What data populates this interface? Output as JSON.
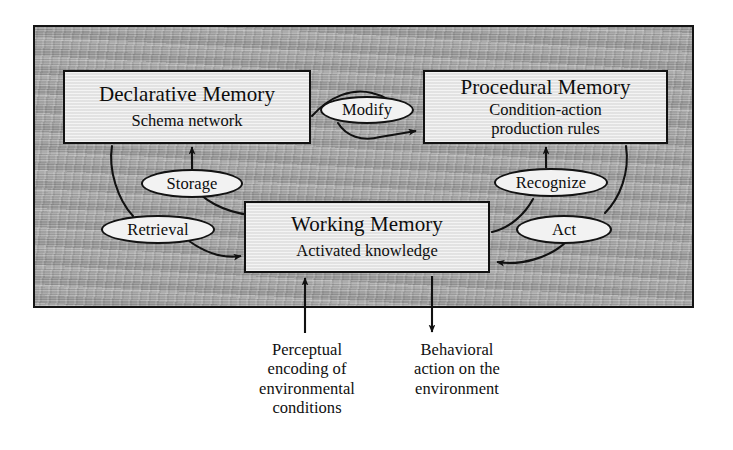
{
  "diagram": {
    "panel": {
      "name": "shaded-background-panel",
      "fill_color": "#a5a5a5",
      "border_color": "#141414"
    },
    "nodes": [
      {
        "id": "declarative-memory",
        "title": "Declarative Memory",
        "subtitle_line1": "Schema network",
        "subtitle_line2": ""
      },
      {
        "id": "procedural-memory",
        "title": "Procedural Memory",
        "subtitle_line1": "Condition-action",
        "subtitle_line2": "production rules"
      },
      {
        "id": "working-memory",
        "title": "Working Memory",
        "subtitle_line1": "Activated knowledge",
        "subtitle_line2": ""
      }
    ],
    "edge_labels": [
      {
        "id": "storage",
        "text": "Storage",
        "from": "working-memory",
        "to": "declarative-memory"
      },
      {
        "id": "retrieval",
        "text": "Retrieval",
        "from": "declarative-memory",
        "to": "working-memory"
      },
      {
        "id": "modify",
        "text": "Modify",
        "from": "declarative-memory",
        "to": "procedural-memory"
      },
      {
        "id": "recognize",
        "text": "Recognize",
        "from": "working-memory",
        "to": "procedural-memory"
      },
      {
        "id": "act",
        "text": "Act",
        "from": "procedural-memory",
        "to": "working-memory"
      }
    ],
    "captions": [
      {
        "id": "perceptual-input",
        "line1": "Perceptual",
        "line2": "encoding of",
        "line3": "environmental",
        "line4": "conditions",
        "direction": "into-working-memory"
      },
      {
        "id": "behavioral-output",
        "line1": "Behavioral",
        "line2": "action on the",
        "line3": "environment",
        "line4": "",
        "direction": "out-of-working-memory"
      }
    ],
    "stroke_color": "#111111",
    "box_fill": "#e7e7e7"
  }
}
